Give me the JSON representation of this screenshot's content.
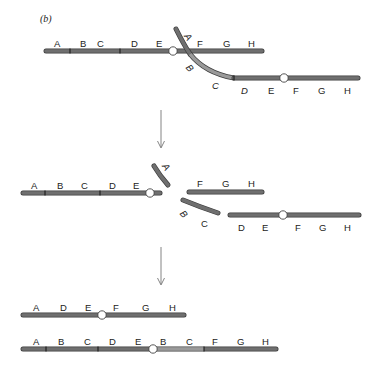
{
  "panel_label": "(b)",
  "colors": {
    "chromosome_dark": "#6f6f6f",
    "chromosome_light": "#9a9a9a",
    "outline": "#3c3c3c",
    "centromere_fill": "#ffffff",
    "arrow": "#777777"
  },
  "stage1": {
    "top_chromosome": {
      "labels": [
        "A",
        "B",
        "C",
        "D",
        "E",
        "F",
        "G",
        "H"
      ]
    },
    "crossing_chromosome": {
      "labels_italic": [
        "A",
        "B",
        "C",
        "D"
      ],
      "labels": [
        "E",
        "F",
        "G",
        "H"
      ]
    }
  },
  "stage2": {
    "left_fragment": {
      "labels": [
        "A",
        "B",
        "C",
        "D",
        "E"
      ]
    },
    "small_fragment": {
      "labels_italic": [
        "A"
      ]
    },
    "right_fragment": {
      "labels": [
        "F",
        "G",
        "H"
      ]
    },
    "curved_fragment": {
      "labels_italic": [
        "B",
        "C"
      ]
    },
    "lower_fragment": {
      "labels": [
        "D",
        "E",
        "F",
        "G",
        "H"
      ]
    }
  },
  "stage3": {
    "deletion_chromosome": {
      "labels": [
        "A",
        "D",
        "E",
        "F",
        "G",
        "H"
      ]
    },
    "duplication_chromosome": {
      "labels": [
        "A",
        "B",
        "C",
        "D",
        "E",
        "B",
        "C",
        "F",
        "G",
        "H"
      ]
    }
  }
}
